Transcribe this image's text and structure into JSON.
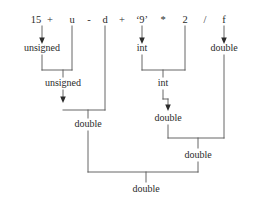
{
  "diagram": {
    "kind": "expression-type-promotion-tree",
    "colors": {
      "text": "#2b2b2b",
      "line": "#555555",
      "background": "#ffffff"
    },
    "expression": {
      "full_text": "15 + u - d + '9' * 2 / f",
      "tokens": [
        {
          "text": "15",
          "x": 36,
          "y": 20,
          "role": "operand"
        },
        {
          "text": "+",
          "x": 50,
          "y": 20,
          "role": "operator"
        },
        {
          "text": "u",
          "x": 72,
          "y": 20,
          "role": "operand"
        },
        {
          "text": "-",
          "x": 89,
          "y": 20,
          "role": "operator"
        },
        {
          "text": "d",
          "x": 105,
          "y": 20,
          "role": "operand"
        },
        {
          "text": "+",
          "x": 122,
          "y": 20,
          "role": "operator"
        },
        {
          "text": "‘9’",
          "x": 142,
          "y": 20,
          "role": "operand"
        },
        {
          "text": "*",
          "x": 163,
          "y": 20,
          "role": "operator"
        },
        {
          "text": "2",
          "x": 185,
          "y": 20,
          "role": "operand"
        },
        {
          "text": "/",
          "x": 205,
          "y": 20,
          "role": "operator"
        },
        {
          "text": "f",
          "x": 224,
          "y": 20,
          "role": "operand"
        }
      ]
    },
    "type_nodes": [
      {
        "id": "t1",
        "text": "unsigned",
        "x": 42,
        "y": 48,
        "level": 1
      },
      {
        "id": "t2",
        "text": "int",
        "x": 142,
        "y": 48,
        "level": 1
      },
      {
        "id": "t3",
        "text": "double",
        "x": 224,
        "y": 48,
        "level": 1
      },
      {
        "id": "t4",
        "text": "unsigned",
        "x": 63,
        "y": 83,
        "level": 2
      },
      {
        "id": "t5",
        "text": "int",
        "x": 163,
        "y": 83,
        "level": 2
      },
      {
        "id": "t6",
        "text": "double",
        "x": 88,
        "y": 124,
        "level": 3
      },
      {
        "id": "t7",
        "text": "double",
        "x": 168,
        "y": 118,
        "level": 3
      },
      {
        "id": "t8",
        "text": "double",
        "x": 198,
        "y": 155,
        "level": 4
      },
      {
        "id": "t9",
        "text": "double",
        "x": 146,
        "y": 189,
        "level": 5
      }
    ]
  }
}
